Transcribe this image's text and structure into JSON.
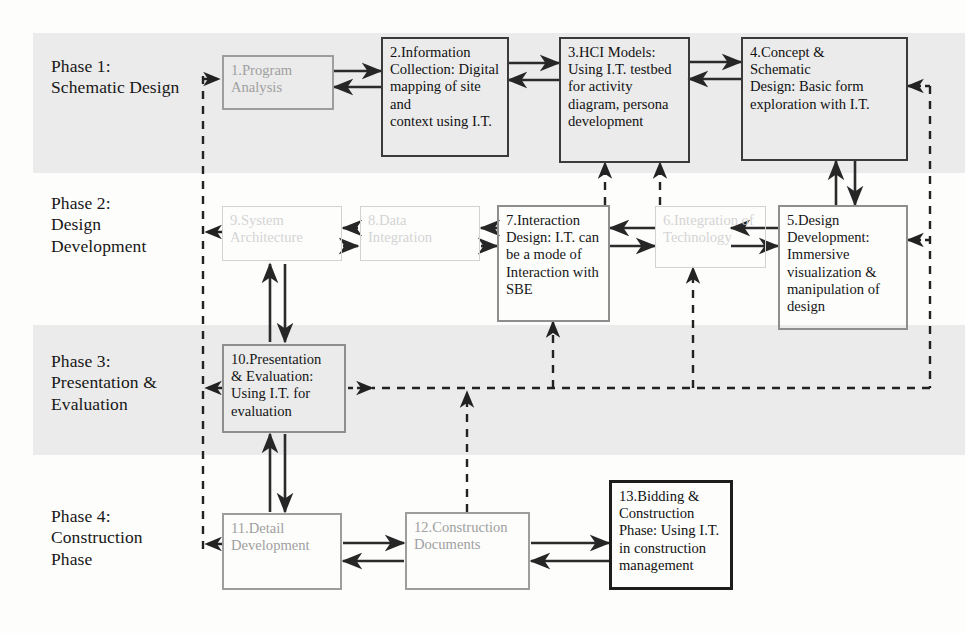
{
  "diagram": {
    "colors": {
      "band": "#ebebeb",
      "page": "#fdfdfc",
      "strong_border": "#3a3a3a",
      "mid_border": "#9d9d9d",
      "faint_border": "#d2d2d2",
      "black_border": "#1d1d1d",
      "text": "#141414",
      "faded_text": "#d4d4d4"
    }
  },
  "phases": [
    {
      "id": "phase-1",
      "label": "Phase 1:\nSchematic Design"
    },
    {
      "id": "phase-2",
      "label": "Phase 2:\nDesign\nDevelopment"
    },
    {
      "id": "phase-3",
      "label": "Phase 3:\nPresentation &\nEvaluation"
    },
    {
      "id": "phase-4",
      "label": "Phase 4:\nConstruction\nPhase"
    }
  ],
  "nodes": [
    {
      "id": "node-1",
      "number": "1",
      "style": "mid",
      "text": "1.Program\nAnalysis"
    },
    {
      "id": "node-2",
      "number": "2",
      "style": "dark",
      "text": "2.Information\nCollection: Digital\nmapping of site and\ncontext using I.T."
    },
    {
      "id": "node-3",
      "number": "3",
      "style": "dark",
      "text": "3.HCI Models:\nUsing I.T. testbed\nfor activity\ndiagram, persona\ndevelopment"
    },
    {
      "id": "node-4",
      "number": "4",
      "style": "dark",
      "text": "4.Concept  &\nSchematic\n Design: Basic form\nexploration with I.T."
    },
    {
      "id": "node-5",
      "number": "5",
      "style": "midtext",
      "text": "5.Design\nDevelopment:\nImmersive\nvisualization &\nmanipulation of\ndesign"
    },
    {
      "id": "node-6",
      "number": "6",
      "style": "faint",
      "text": "6.Integration of\nTechnology"
    },
    {
      "id": "node-7",
      "number": "7",
      "style": "midtext",
      "text": "7.Interaction\nDesign: I.T. can\nbe a mode of\nInteraction with\nSBE"
    },
    {
      "id": "node-8",
      "number": "8",
      "style": "faint",
      "text": "8.Data\nIntegration"
    },
    {
      "id": "node-9",
      "number": "9",
      "style": "faint",
      "text": "9.System\nArchitecture"
    },
    {
      "id": "node-10",
      "number": "10",
      "style": "midtext",
      "text": "10.Presentation\n& Evaluation:\nUsing I.T. for\nevaluation"
    },
    {
      "id": "node-11",
      "number": "11",
      "style": "mid",
      "text": "11.Detail\nDevelopment"
    },
    {
      "id": "node-12",
      "number": "12",
      "style": "mid",
      "text": "12.Construction\nDocuments"
    },
    {
      "id": "node-13",
      "number": "13",
      "style": "black",
      "text": "13.Bidding &\nConstruction\nPhase: Using I.T.\nin construction\nmanagement"
    }
  ],
  "connections": [
    {
      "id": "conn-1-2",
      "from": "node-1",
      "to": "node-2",
      "kind": "solid",
      "direction": "both"
    },
    {
      "id": "conn-2-3",
      "from": "node-2",
      "to": "node-3",
      "kind": "solid",
      "direction": "both"
    },
    {
      "id": "conn-3-4",
      "from": "node-3",
      "to": "node-4",
      "kind": "solid",
      "direction": "both"
    },
    {
      "id": "conn-4-5",
      "from": "node-4",
      "to": "node-5",
      "kind": "solid",
      "direction": "both"
    },
    {
      "id": "conn-5-6",
      "from": "node-5",
      "to": "node-6",
      "kind": "solid",
      "direction": "both"
    },
    {
      "id": "conn-6-7",
      "from": "node-6",
      "to": "node-7",
      "kind": "solid",
      "direction": "both"
    },
    {
      "id": "conn-7-8",
      "from": "node-7",
      "to": "node-8",
      "kind": "solid",
      "direction": "both"
    },
    {
      "id": "conn-8-9",
      "from": "node-8",
      "to": "node-9",
      "kind": "solid",
      "direction": "both"
    },
    {
      "id": "conn-9-10",
      "from": "node-9",
      "to": "node-10",
      "kind": "solid",
      "direction": "both"
    },
    {
      "id": "conn-10-11",
      "from": "node-10",
      "to": "node-11",
      "kind": "solid",
      "direction": "both"
    },
    {
      "id": "conn-11-12",
      "from": "node-11",
      "to": "node-12",
      "kind": "solid",
      "direction": "both"
    },
    {
      "id": "conn-12-13",
      "from": "node-12",
      "to": "node-13",
      "kind": "solid",
      "direction": "both"
    },
    {
      "id": "conn-7-3",
      "from": "node-7",
      "to": "node-3",
      "kind": "dashed",
      "direction": "up"
    },
    {
      "id": "conn-6-3",
      "from": "node-6",
      "to": "node-3",
      "kind": "dashed",
      "direction": "up"
    },
    {
      "id": "conn-10-7",
      "from": "node-10",
      "to": "node-7",
      "kind": "dashed",
      "direction": "up"
    },
    {
      "id": "conn-10-6",
      "from": "node-10",
      "to": "node-6",
      "kind": "dashed",
      "direction": "up"
    },
    {
      "id": "conn-12-feedback",
      "from": "node-12",
      "to": "feedback-bus-right",
      "kind": "dashed",
      "direction": "up"
    },
    {
      "id": "conn-feedback-left",
      "from": "feedback-bus-left",
      "to": "node-1",
      "kind": "dashed",
      "direction": "right"
    },
    {
      "id": "conn-9-bus",
      "from": "node-9",
      "to": "feedback-bus-left",
      "kind": "dashed",
      "direction": "left"
    },
    {
      "id": "conn-10-bus",
      "from": "node-10",
      "to": "feedback-bus-left",
      "kind": "dashed",
      "direction": "left"
    },
    {
      "id": "conn-11-bus",
      "from": "node-11",
      "to": "feedback-bus-left",
      "kind": "dashed",
      "direction": "left"
    },
    {
      "id": "conn-bus-4",
      "from": "feedback-bus-right",
      "to": "node-4",
      "kind": "dashed",
      "direction": "left"
    },
    {
      "id": "conn-bus-5",
      "from": "feedback-bus-right",
      "to": "node-5",
      "kind": "dashed",
      "direction": "left"
    },
    {
      "id": "conn-10-busright",
      "from": "node-10",
      "to": "feedback-bus-right",
      "kind": "dashed",
      "direction": "right"
    }
  ]
}
